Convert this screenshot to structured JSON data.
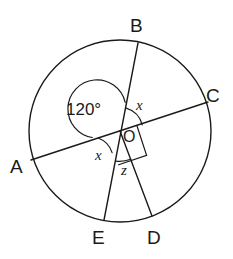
{
  "figure": {
    "kind": "circle-geometry-diagram",
    "background_color": "#ffffff",
    "stroke_color": "#1a1a1a",
    "circle": {
      "cx": 120,
      "cy": 131,
      "r": 91
    },
    "center_label": "O",
    "vertices": [
      {
        "name": "A",
        "label": "A",
        "label_x": 10,
        "label_y": 157,
        "point_x": 31,
        "point_y": 160
      },
      {
        "name": "B",
        "label": "B",
        "label_x": 130,
        "label_y": 16,
        "point_x": 138,
        "point_y": 43
      },
      {
        "name": "C",
        "label": "C",
        "label_x": 206,
        "label_y": 86,
        "point_x": 208,
        "point_y": 102
      },
      {
        "name": "D",
        "label": "D",
        "label_x": 147,
        "label_y": 228,
        "point_x": 152,
        "point_y": 216
      },
      {
        "name": "E",
        "label": "E",
        "label_x": 92,
        "label_y": 228,
        "point_x": 104,
        "point_y": 220
      }
    ],
    "angle_marks": [
      {
        "name": "angle-aob",
        "label": "120°",
        "label_x": 66,
        "label_y": 101,
        "value": "120°",
        "arc": true
      },
      {
        "name": "angle-boc",
        "label": "x",
        "label_x": 136,
        "label_y": 98
      },
      {
        "name": "angle-aoe",
        "label": "x",
        "label_x": 95,
        "label_y": 148
      },
      {
        "name": "angle-eod",
        "label": "z",
        "label_x": 121,
        "label_y": 163
      },
      {
        "name": "angle-cod",
        "label": "",
        "right_angle": true
      }
    ],
    "chords": [
      {
        "name": "diameter-ac",
        "from": "A",
        "to": "C"
      },
      {
        "name": "diameter-be",
        "from": "B",
        "to": "E"
      },
      {
        "name": "radius-od",
        "from": "O",
        "to": "D"
      }
    ]
  }
}
